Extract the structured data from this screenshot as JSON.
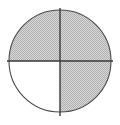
{
  "figure": {
    "name": "fraction-circle",
    "shape": "circle",
    "total_parts": 4,
    "shaded_parts": 3,
    "fraction_label": "3/4",
    "background_color": "#ffffff"
  },
  "canvas": {
    "width": 120,
    "height": 125
  },
  "circle": {
    "center_x": 60,
    "center_y": 61,
    "radius": 51,
    "outline_color": "#4a4a4a",
    "outline_width": 1.1,
    "fill_color": "#ffffff"
  },
  "dividers": [
    {
      "name": "vertical-diameter",
      "orientation": "vertical",
      "x1": 60,
      "y1": 8,
      "x2": 60,
      "y2": 116,
      "color": "#3a3a3a",
      "width": 1.4
    },
    {
      "name": "horizontal-diameter",
      "orientation": "horizontal",
      "x1": 7,
      "y1": 61,
      "x2": 113,
      "y2": 61,
      "color": "#3a3a3a",
      "width": 1.4
    }
  ],
  "quadrants": [
    {
      "name": "top-left",
      "position": "upper-left",
      "shaded": true,
      "fill_color": "#c9c9c9",
      "start_angle": 180,
      "end_angle": 270
    },
    {
      "name": "top-right",
      "position": "upper-right",
      "shaded": true,
      "fill_color": "#c9c9c9",
      "start_angle": 270,
      "end_angle": 360
    },
    {
      "name": "bottom-right",
      "position": "lower-right",
      "shaded": true,
      "fill_color": "#c9c9c9",
      "start_angle": 0,
      "end_angle": 90
    },
    {
      "name": "bottom-left",
      "position": "lower-left",
      "shaded": false,
      "fill_color": "#ffffff",
      "start_angle": 90,
      "end_angle": 180
    }
  ],
  "texture": {
    "name": "stipple-halftone",
    "type": "checkerboard-dither",
    "dot_color": "#b0b0b0",
    "base_color": "#d8d8d8",
    "cell_size": 2
  }
}
